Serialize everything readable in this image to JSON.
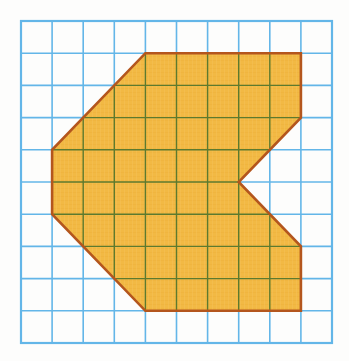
{
  "figure": {
    "canvas": {
      "width": 349,
      "height": 361,
      "background": "#fdfdfc"
    }
  },
  "grid": {
    "name": "square-grid",
    "columns": 10,
    "rows": 10,
    "origin_x": 21,
    "origin_y": 21,
    "cell_width": 31.1,
    "cell_height": 32.2,
    "line_color": "#63b6e8",
    "line_width": 1.6,
    "border_color": "#63b6e8",
    "border_width": 2.2
  },
  "shape": {
    "name": "shaded-polygon",
    "fill_color": "#f2b944",
    "fill_texture_color": "#edb23c",
    "outline_color": "#b4561d",
    "outline_width": 2.6,
    "inner_grid_color": "#5d7a2e",
    "inner_grid_width": 1.4,
    "vertices_grid": [
      [
        4,
        1
      ],
      [
        9,
        1
      ],
      [
        9,
        3
      ],
      [
        7,
        5
      ],
      [
        9,
        7
      ],
      [
        9,
        9
      ],
      [
        4,
        9
      ],
      [
        1,
        6
      ],
      [
        1,
        4
      ]
    ],
    "vertices_px": [
      [
        145.4,
        53.2
      ],
      [
        300.9,
        53.2
      ],
      [
        300.9,
        117.6
      ],
      [
        238.7,
        182.0
      ],
      [
        300.9,
        246.4
      ],
      [
        300.9,
        310.8
      ],
      [
        145.4,
        310.8
      ],
      [
        52.1,
        214.2
      ],
      [
        52.1,
        149.8
      ]
    ],
    "edge_count": 9,
    "notch": {
      "name": "right-side-triangular-notch",
      "apex_grid": [
        7,
        5
      ],
      "opening_top_grid": [
        9,
        3
      ],
      "opening_bottom_grid": [
        9,
        7
      ]
    }
  },
  "chart_data": {
    "type": "scatter",
    "xlabel": "",
    "ylabel": "",
    "xlim": [
      0,
      10
    ],
    "ylim": [
      0,
      10
    ],
    "grid": true,
    "legend": "none",
    "categories": [],
    "values": [],
    "series": [
      {
        "name": "polygon-outline",
        "x": [
          4,
          9,
          9,
          7,
          9,
          9,
          4,
          1,
          1,
          4
        ],
        "y": [
          1,
          1,
          3,
          5,
          7,
          9,
          9,
          6,
          4,
          1
        ]
      }
    ],
    "annotations": []
  }
}
